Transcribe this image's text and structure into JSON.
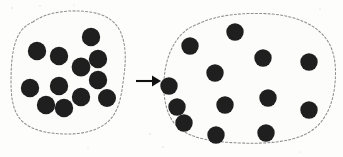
{
  "figure": {
    "kind": "schematic-diagram",
    "width": 343,
    "height": 157,
    "background_color": "#fdfdfc"
  },
  "colors": {
    "particle": "#1f1f1f",
    "outline": "#8e8e8e",
    "arrow": "#111111",
    "background": "#fdfdfc",
    "blob_fill": "#fcfcfb",
    "speck": "#d8d8d5"
  },
  "style": {
    "outline_dash": "2.1 2.1",
    "outline_width": 1.05,
    "particle_radius_left": 9.0,
    "particle_radius_right": 8.6
  },
  "left_region": {
    "name": "dense-particle-region",
    "label": "",
    "particle_count": 12,
    "outline_path": "M 33 22 C 46 12, 70 9, 90 12 C 105 14, 116 21, 121 33 C 126 45, 126 60, 124 75 C 122 90, 121 104, 113 116 C 104 129, 86 134, 68 134 C 50 134, 33 131, 23 122 C 13 113, 11 98, 11 82 C 11 66, 12 50, 17 38 C 21 29, 26 25, 33 22 Z",
    "particles": [
      {
        "cx": 37,
        "cy": 51,
        "r": 9.2
      },
      {
        "cx": 59,
        "cy": 56,
        "r": 9.2
      },
      {
        "cx": 91,
        "cy": 37,
        "r": 9.2
      },
      {
        "cx": 98,
        "cy": 59,
        "r": 9.2
      },
      {
        "cx": 81,
        "cy": 67,
        "r": 9.4
      },
      {
        "cx": 98,
        "cy": 80,
        "r": 9.2
      },
      {
        "cx": 59,
        "cy": 86,
        "r": 9.2
      },
      {
        "cx": 30,
        "cy": 88,
        "r": 9.2
      },
      {
        "cx": 46,
        "cy": 105,
        "r": 9.2
      },
      {
        "cx": 64,
        "cy": 108,
        "r": 9.2
      },
      {
        "cx": 81,
        "cy": 97,
        "r": 9.2
      },
      {
        "cx": 107,
        "cy": 98,
        "r": 9.0
      }
    ]
  },
  "right_region": {
    "name": "sparse-particle-region",
    "label": "",
    "particle_count": 13,
    "outline_path": "M 198 24 C 215 15, 245 12, 272 14 C 295 16, 316 24, 327 40 C 336 53, 337 72, 334 91 C 331 110, 322 126, 306 134 C 290 142, 266 144, 240 143 C 214 142, 192 139, 179 128 C 167 118, 163 100, 164 81 C 165 62, 171 44, 183 33 C 188 28, 193 26, 198 24 Z",
    "particles": [
      {
        "cx": 190,
        "cy": 46,
        "r": 8.7
      },
      {
        "cx": 235,
        "cy": 32,
        "r": 8.7
      },
      {
        "cx": 263,
        "cy": 58,
        "r": 8.7
      },
      {
        "cx": 309,
        "cy": 62,
        "r": 8.7
      },
      {
        "cx": 215,
        "cy": 73,
        "r": 8.7
      },
      {
        "cx": 169,
        "cy": 86,
        "r": 8.7
      },
      {
        "cx": 268,
        "cy": 98,
        "r": 8.7
      },
      {
        "cx": 225,
        "cy": 105,
        "r": 8.7
      },
      {
        "cx": 309,
        "cy": 110,
        "r": 8.7
      },
      {
        "cx": 184,
        "cy": 123,
        "r": 8.7
      },
      {
        "cx": 216,
        "cy": 135,
        "r": 8.7
      },
      {
        "cx": 266,
        "cy": 133,
        "r": 8.7
      },
      {
        "cx": 177,
        "cy": 107,
        "r": 8.7
      }
    ]
  },
  "arrow": {
    "name": "transition-arrow",
    "direction": "right",
    "label": "",
    "x1": 136,
    "y1": 81,
    "x2": 152,
    "y2": 81,
    "head_points": "152,75.5 161,81 152,86.5",
    "stroke_width": 2.1
  },
  "specks": [
    {
      "cx": 12,
      "cy": 8,
      "r": 0.8
    },
    {
      "cx": 40,
      "cy": 6,
      "r": 0.7
    },
    {
      "cx": 74,
      "cy": 5,
      "r": 0.6
    },
    {
      "cx": 150,
      "cy": 134,
      "r": 0.8
    },
    {
      "cx": 163,
      "cy": 147,
      "r": 0.7
    },
    {
      "cx": 320,
      "cy": 9,
      "r": 0.7
    },
    {
      "cx": 300,
      "cy": 152,
      "r": 0.6
    },
    {
      "cx": 88,
      "cy": 148,
      "r": 0.6
    }
  ]
}
